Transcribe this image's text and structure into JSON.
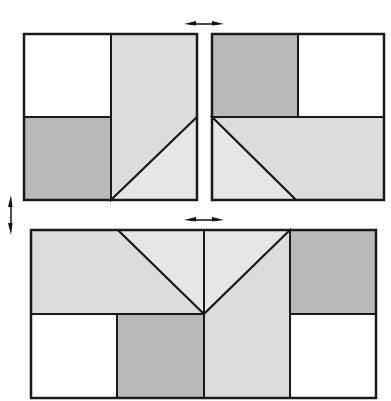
{
  "canvas": {
    "width": 391,
    "height": 401,
    "background": "#ffffff"
  },
  "colors": {
    "white": "#ffffff",
    "dark": "#b9b9b9",
    "light": "#dcdcdc",
    "lighter": "#e6e6e6",
    "stroke": "#1a1a1a",
    "arrow": "#111111"
  },
  "panels": [
    {
      "id": "top-left-panel",
      "frame": [
        24,
        34,
        197,
        200
      ],
      "regions": [
        {
          "name": "white-square",
          "fill": "white",
          "points": [
            [
              24,
              34
            ],
            [
              111,
              34
            ],
            [
              111,
              117
            ],
            [
              24,
              117
            ]
          ]
        },
        {
          "name": "dark-square",
          "fill": "dark",
          "points": [
            [
              24,
              117
            ],
            [
              111,
              117
            ],
            [
              111,
              200
            ],
            [
              24,
              200
            ]
          ]
        },
        {
          "name": "light-trapezoid",
          "fill": "light",
          "points": [
            [
              111,
              34
            ],
            [
              197,
              34
            ],
            [
              197,
              117
            ],
            [
              111,
              200
            ]
          ]
        },
        {
          "name": "lighter-triangle",
          "fill": "lighter",
          "points": [
            [
              111,
              200
            ],
            [
              197,
              117
            ],
            [
              197,
              200
            ]
          ]
        }
      ]
    },
    {
      "id": "top-right-panel",
      "frame": [
        212,
        34,
        384,
        200
      ],
      "regions": [
        {
          "name": "dark-square",
          "fill": "dark",
          "points": [
            [
              212,
              34
            ],
            [
              298,
              34
            ],
            [
              298,
              117
            ],
            [
              212,
              117
            ]
          ]
        },
        {
          "name": "white-square",
          "fill": "white",
          "points": [
            [
              298,
              34
            ],
            [
              384,
              34
            ],
            [
              384,
              117
            ],
            [
              298,
              117
            ]
          ]
        },
        {
          "name": "light-trapezoid",
          "fill": "light",
          "points": [
            [
              212,
              117
            ],
            [
              384,
              117
            ],
            [
              384,
              200
            ],
            [
              296,
              200
            ]
          ]
        },
        {
          "name": "lighter-triangle",
          "fill": "lighter",
          "points": [
            [
              212,
              117
            ],
            [
              296,
              200
            ],
            [
              212,
              200
            ]
          ]
        }
      ]
    },
    {
      "id": "bottom-panel",
      "frame": [
        31,
        230,
        376,
        398
      ],
      "regions": [
        {
          "name": "light-trapezoid-left",
          "fill": "light",
          "points": [
            [
              31,
              230
            ],
            [
              118,
              230
            ],
            [
              204,
              314
            ],
            [
              31,
              314
            ]
          ]
        },
        {
          "name": "lighter-triangle-left",
          "fill": "lighter",
          "points": [
            [
              118,
              230
            ],
            [
              204,
              230
            ],
            [
              204,
              314
            ]
          ]
        },
        {
          "name": "lighter-triangle-right",
          "fill": "lighter",
          "points": [
            [
              204,
              230
            ],
            [
              290,
              230
            ],
            [
              204,
              314
            ]
          ]
        },
        {
          "name": "light-trapezoid-right",
          "fill": "light",
          "points": [
            [
              290,
              230
            ],
            [
              290,
              398
            ],
            [
              204,
              398
            ],
            [
              204,
              314
            ]
          ]
        },
        {
          "name": "white-square-left",
          "fill": "white",
          "points": [
            [
              31,
              314
            ],
            [
              117,
              314
            ],
            [
              117,
              398
            ],
            [
              31,
              398
            ]
          ]
        },
        {
          "name": "dark-square-mid",
          "fill": "dark",
          "points": [
            [
              117,
              314
            ],
            [
              204,
              314
            ],
            [
              204,
              398
            ],
            [
              117,
              398
            ]
          ]
        },
        {
          "name": "dark-square-right",
          "fill": "dark",
          "points": [
            [
              290,
              230
            ],
            [
              376,
              230
            ],
            [
              376,
              314
            ],
            [
              290,
              314
            ]
          ]
        },
        {
          "name": "white-square-right",
          "fill": "white",
          "points": [
            [
              290,
              314
            ],
            [
              376,
              314
            ],
            [
              376,
              398
            ],
            [
              290,
              398
            ]
          ]
        }
      ]
    }
  ],
  "arrows": [
    {
      "name": "horizontal-double-arrow-top",
      "orientation": "horizontal",
      "cx": 204,
      "cy": 24,
      "length": 40
    },
    {
      "name": "horizontal-double-arrow-middle",
      "orientation": "horizontal",
      "cx": 204,
      "cy": 220,
      "length": 40
    },
    {
      "name": "vertical-double-arrow-left",
      "orientation": "vertical",
      "cx": 11,
      "cy": 215,
      "length": 40
    }
  ]
}
